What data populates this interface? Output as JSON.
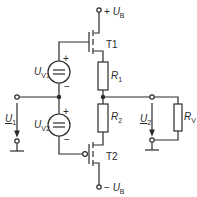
{
  "diagram": {
    "type": "circuit-schematic",
    "colors": {
      "line": "#2a2a2a",
      "background": "#ffffff"
    },
    "supply_top": {
      "sign": "+",
      "symbol": "U",
      "subscript": "B"
    },
    "supply_bottom": {
      "sign": "−",
      "symbol": "U",
      "subscript": "B"
    },
    "transistors": [
      {
        "label": "T1",
        "type": "n-channel enhancement MOSFET"
      },
      {
        "label": "T2",
        "type": "p-channel enhancement MOSFET"
      }
    ],
    "voltage_sources": [
      {
        "symbol": "U",
        "subscript": "V1",
        "plus": "+",
        "minus": "−"
      },
      {
        "symbol": "U",
        "subscript": "V2",
        "plus": "+",
        "minus": "−"
      }
    ],
    "resistors": [
      {
        "symbol": "R",
        "subscript": "1"
      },
      {
        "symbol": "R",
        "subscript": "2"
      },
      {
        "symbol": "R",
        "subscript": "V"
      }
    ],
    "input_voltage": {
      "symbol": "U",
      "subscript": "1"
    },
    "output_voltage": {
      "symbol": "U",
      "subscript": "2"
    }
  }
}
